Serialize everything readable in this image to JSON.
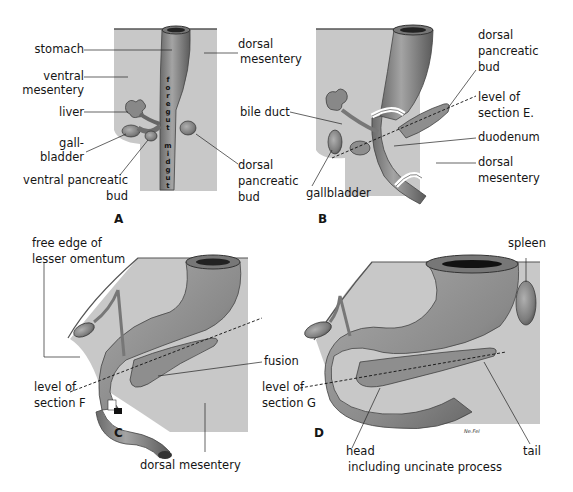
{
  "figure": {
    "panels": [
      {
        "letter": "A",
        "labels": {
          "stomach": "stomach",
          "ventral_mesentery_1": "ventral",
          "ventral_mesentery_2": "mesentery",
          "liver": "liver",
          "gallbladder_1": "gall-",
          "gallbladder_2": "bladder",
          "ventral_pancreatic_bud_1": "ventral pancreatic",
          "ventral_pancreatic_bud_2": "bud",
          "dorsal_mesentery_1": "dorsal",
          "dorsal_mesentery_2": "mesentery",
          "dorsal_pancreatic_bud_1": "dorsal",
          "dorsal_pancreatic_bud_2": "pancreatic",
          "dorsal_pancreatic_bud_3": "bud",
          "foregut": "foregut",
          "midgut": "midgut"
        }
      },
      {
        "letter": "B",
        "labels": {
          "dorsal_pancreatic_bud_1": "dorsal",
          "dorsal_pancreatic_bud_2": "pancreatic",
          "dorsal_pancreatic_bud_3": "bud",
          "bile_duct": "bile duct",
          "level_of_section_1": "level of",
          "level_of_section_2": "section E.",
          "duodenum": "duodenum",
          "dorsal_mesentery_1": "dorsal",
          "dorsal_mesentery_2": "mesentery",
          "gallbladder": "gallbladder"
        }
      },
      {
        "letter": "C",
        "labels": {
          "free_edge_1": "free edge of",
          "free_edge_2": "lesser omentum",
          "fusion": "fusion",
          "level_of_section_1": "level of",
          "level_of_section_2": "section F",
          "dorsal_mesentery": "dorsal mesentery"
        }
      },
      {
        "letter": "D",
        "labels": {
          "spleen": "spleen",
          "level_of_section_1": "level of",
          "level_of_section_2": "section G",
          "head_1": "head",
          "head_2": "including uncinate process",
          "tail": "tail",
          "signature": "Ne.Fel"
        }
      }
    ],
    "colors": {
      "mesentery_fill": "#c9c9c9",
      "gut_fill": "#8a8a8a",
      "gut_dark": "#4a4a4a",
      "label_text": "#151515",
      "background": "#ffffff"
    }
  }
}
